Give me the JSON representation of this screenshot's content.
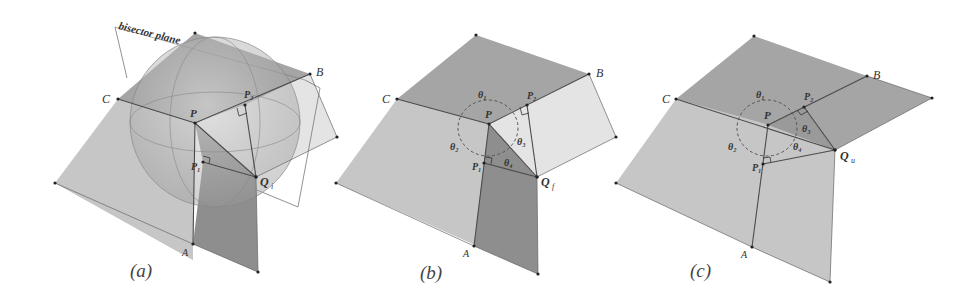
{
  "figure": {
    "panels": [
      {
        "id": "a",
        "caption": "(a)",
        "annotation": "bisector plane",
        "labels": {
          "A": "A",
          "B": "B",
          "C": "C",
          "P": "P",
          "P1": "P₁",
          "P2": "P₂",
          "Q": "Q",
          "Q_sub": "i"
        }
      },
      {
        "id": "b",
        "caption": "(b)",
        "labels": {
          "A": "A",
          "B": "B",
          "C": "C",
          "P": "P",
          "P1": "P₁",
          "P2": "P₂",
          "Q": "Q",
          "Q_sub": "f",
          "theta1": "θ₁",
          "theta2": "θ₂",
          "theta3": "θ₃",
          "theta4": "θ₄"
        }
      },
      {
        "id": "c",
        "caption": "(c)",
        "labels": {
          "A": "A",
          "B": "B",
          "C": "C",
          "P": "P",
          "P1": "P₁",
          "P2": "P₂",
          "Q": "Q",
          "Q_sub": "u",
          "theta1": "θ₁",
          "theta2": "θ₂",
          "theta3": "θ₃",
          "theta4": "θ₄"
        }
      }
    ],
    "colors": {
      "face_light": "#c8c8c8",
      "face_mid": "#a9a9a9",
      "face_dark": "#8f8f8f",
      "face_pale": "#e6e6e6",
      "edge": "#4a4a4a",
      "dashed": "#555555"
    }
  }
}
